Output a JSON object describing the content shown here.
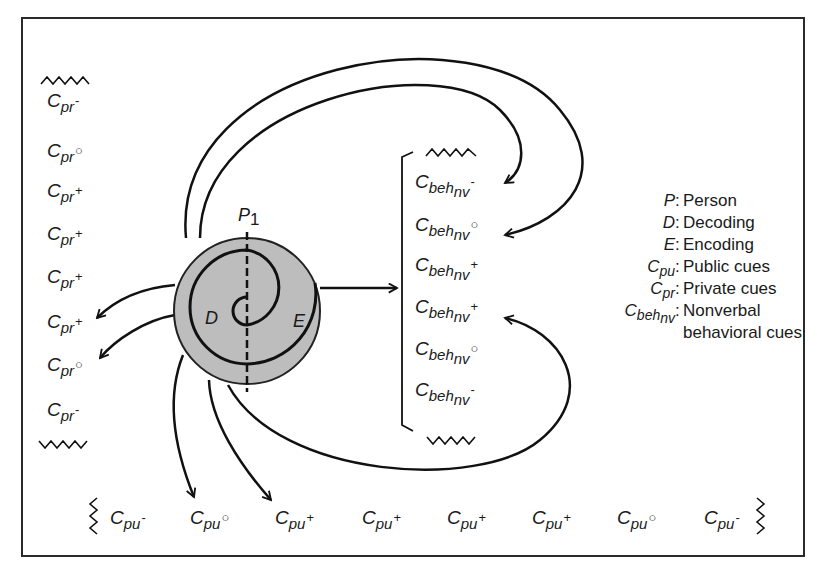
{
  "diagram": {
    "person_label": {
      "main": "P",
      "sub": "1"
    },
    "decoding_label": "D",
    "encoding_label": "E",
    "private_cues": [
      {
        "base": "C",
        "sub": "pr",
        "sign": "-"
      },
      {
        "base": "C",
        "sub": "pr",
        "sign": "○"
      },
      {
        "base": "C",
        "sub": "pr",
        "sign": "+"
      },
      {
        "base": "C",
        "sub": "pr",
        "sign": "+"
      },
      {
        "base": "C",
        "sub": "pr",
        "sign": "+"
      },
      {
        "base": "C",
        "sub": "pr",
        "sign": "+"
      },
      {
        "base": "C",
        "sub": "pr",
        "sign": "○"
      },
      {
        "base": "C",
        "sub": "pr",
        "sign": "-"
      }
    ],
    "behavioral_cues": [
      {
        "base": "C",
        "sub": "beh",
        "subsub": "nv",
        "sign": "-"
      },
      {
        "base": "C",
        "sub": "beh",
        "subsub": "nv",
        "sign": "○"
      },
      {
        "base": "C",
        "sub": "beh",
        "subsub": "nv",
        "sign": "+"
      },
      {
        "base": "C",
        "sub": "beh",
        "subsub": "nv",
        "sign": "+"
      },
      {
        "base": "C",
        "sub": "beh",
        "subsub": "nv",
        "sign": "○"
      },
      {
        "base": "C",
        "sub": "beh",
        "subsub": "nv",
        "sign": "-"
      }
    ],
    "public_cues": [
      {
        "base": "C",
        "sub": "pu",
        "sign": "-"
      },
      {
        "base": "C",
        "sub": "pu",
        "sign": "○"
      },
      {
        "base": "C",
        "sub": "pu",
        "sign": "+"
      },
      {
        "base": "C",
        "sub": "pu",
        "sign": "+"
      },
      {
        "base": "C",
        "sub": "pu",
        "sign": "+"
      },
      {
        "base": "C",
        "sub": "pu",
        "sign": "+"
      },
      {
        "base": "C",
        "sub": "pu",
        "sign": "○"
      },
      {
        "base": "C",
        "sub": "pu",
        "sign": "-"
      }
    ],
    "legend": [
      {
        "key": "P",
        "key_sub": "",
        "value": "Person"
      },
      {
        "key": "D",
        "key_sub": "",
        "value": "Decoding"
      },
      {
        "key": "E",
        "key_sub": "",
        "value": "Encoding"
      },
      {
        "key": "C",
        "key_sub": "pu",
        "value": "Public cues"
      },
      {
        "key": "C",
        "key_sub": "pr",
        "value": "Private cues"
      },
      {
        "key": "C",
        "key_sub": "beh",
        "key_subsub": "nv",
        "value": "Nonverbal",
        "value2": "behavioral cues"
      }
    ],
    "colors": {
      "line": "#111111",
      "person_fill": "#bdbdbd",
      "frame": "#2a2a2a"
    }
  }
}
